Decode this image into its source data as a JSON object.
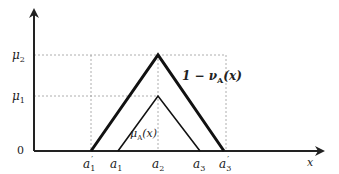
{
  "diagram": {
    "y_labels": {
      "mu2": "μ",
      "mu2_sub": "2",
      "mu1": "μ",
      "mu1_sub": "1",
      "zero": "0"
    },
    "x_labels": {
      "a1p": "a",
      "a1p_sub": "1",
      "a1p_prime": "′",
      "a1": "a",
      "a1_sub": "1",
      "a2": "a",
      "a2_sub": "2",
      "a3": "a",
      "a3_sub": "3",
      "a3p": "a",
      "a3p_sub": "3",
      "a3p_prime": "′",
      "x": "x"
    },
    "curve_labels": {
      "outer": "1 − ν",
      "outer_sub": "A",
      "outer_arg": "(x)",
      "inner": "μ",
      "inner_sub": "A",
      "inner_arg": "(x)"
    }
  }
}
